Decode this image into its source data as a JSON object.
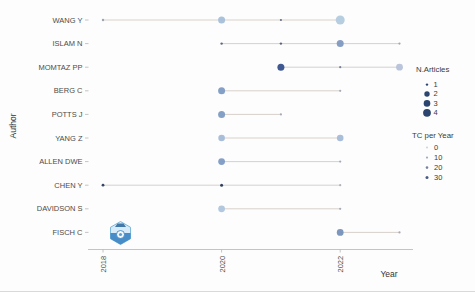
{
  "chart_data": {
    "type": "scatter",
    "title": "",
    "xlabel": "Year",
    "ylabel": "Author",
    "x_ticks": [
      "2018",
      "2020",
      "2022"
    ],
    "x_domain": [
      2017.75,
      2023.5
    ],
    "grid": false,
    "legend_position": "right",
    "authors": [
      "WANG Y",
      "ISLAM N",
      "MOMTAZ PP",
      "BERG C",
      "POTTS J",
      "YANG Z",
      "ALLEN DWE",
      "CHEN Y",
      "DAVIDSON S",
      "FISCH C"
    ],
    "series": [
      {
        "author": "WANG Y",
        "line": [
          2018,
          2022
        ],
        "points": [
          {
            "year": 2018,
            "n_articles": 1,
            "tc_per_year": 2,
            "r": 1.2,
            "color": "#95a0ad"
          },
          {
            "year": 2020,
            "n_articles": 2,
            "tc_per_year": 5,
            "r": 3.5,
            "color": "#a7bfd9"
          },
          {
            "year": 2021,
            "n_articles": 1,
            "tc_per_year": 10,
            "r": 1.1,
            "color": "#5f6d85"
          },
          {
            "year": 2022,
            "n_articles": 3,
            "tc_per_year": 5,
            "r": 4.5,
            "color": "#b3cade"
          }
        ]
      },
      {
        "author": "ISLAM N",
        "line": [
          2020,
          2023
        ],
        "points": [
          {
            "year": 2020,
            "n_articles": 1,
            "tc_per_year": 15,
            "r": 1.2,
            "color": "#525f79"
          },
          {
            "year": 2021,
            "n_articles": 1,
            "tc_per_year": 15,
            "r": 1.2,
            "color": "#525f79"
          },
          {
            "year": 2022,
            "n_articles": 2,
            "tc_per_year": 15,
            "r": 3.5,
            "color": "#8099c1"
          },
          {
            "year": 2023,
            "n_articles": 1,
            "tc_per_year": 5,
            "r": 1.1,
            "color": "#9aa3b2"
          }
        ]
      },
      {
        "author": "MOMTAZ PP",
        "line": [
          2021,
          2023
        ],
        "points": [
          {
            "year": 2021,
            "n_articles": 2,
            "tc_per_year": 30,
            "r": 3.5,
            "color": "#35508c"
          },
          {
            "year": 2022,
            "n_articles": 1,
            "tc_per_year": 10,
            "r": 1.1,
            "color": "#6e7a92"
          },
          {
            "year": 2023,
            "n_articles": 2,
            "tc_per_year": 3,
            "r": 3.4,
            "color": "#b6c1d9"
          }
        ]
      },
      {
        "author": "BERG C",
        "line": [
          2020,
          2022
        ],
        "points": [
          {
            "year": 2020,
            "n_articles": 2,
            "tc_per_year": 15,
            "r": 3.5,
            "color": "#7e9bc4"
          },
          {
            "year": 2022,
            "n_articles": 1,
            "tc_per_year": 0,
            "r": 1.1,
            "color": "#a0a8b4"
          }
        ]
      },
      {
        "author": "POTTS J",
        "line": [
          2020,
          2021
        ],
        "points": [
          {
            "year": 2020,
            "n_articles": 2,
            "tc_per_year": 15,
            "r": 3.5,
            "color": "#7e9bc4"
          },
          {
            "year": 2021,
            "n_articles": 1,
            "tc_per_year": 0,
            "r": 1.1,
            "color": "#a0a8b4"
          }
        ]
      },
      {
        "author": "YANG Z",
        "line": [
          2020,
          2022
        ],
        "points": [
          {
            "year": 2020,
            "n_articles": 2,
            "tc_per_year": 8,
            "r": 3.3,
            "color": "#a3bbd7"
          },
          {
            "year": 2022,
            "n_articles": 2,
            "tc_per_year": 8,
            "r": 3.3,
            "color": "#a3bbd7"
          }
        ]
      },
      {
        "author": "ALLEN DWE",
        "line": [
          2020,
          2022
        ],
        "points": [
          {
            "year": 2020,
            "n_articles": 2,
            "tc_per_year": 15,
            "r": 3.4,
            "color": "#7e9bc4"
          },
          {
            "year": 2022,
            "n_articles": 1,
            "tc_per_year": 0,
            "r": 1.1,
            "color": "#a0a8b4"
          }
        ]
      },
      {
        "author": "CHEN Y",
        "line": [
          2018,
          2022
        ],
        "points": [
          {
            "year": 2018,
            "n_articles": 1,
            "tc_per_year": 30,
            "r": 1.4,
            "color": "#2b3b60"
          },
          {
            "year": 2020,
            "n_articles": 1,
            "tc_per_year": 30,
            "r": 1.5,
            "color": "#27375c"
          },
          {
            "year": 2022,
            "n_articles": 1,
            "tc_per_year": 0,
            "r": 1.1,
            "color": "#a6adb9"
          }
        ]
      },
      {
        "author": "DAVIDSON S",
        "line": [
          2020,
          2022
        ],
        "points": [
          {
            "year": 2020,
            "n_articles": 2,
            "tc_per_year": 5,
            "r": 3.4,
            "color": "#aec5dd"
          },
          {
            "year": 2022,
            "n_articles": 1,
            "tc_per_year": 0,
            "r": 1.1,
            "color": "#a0a8b4"
          }
        ]
      },
      {
        "author": "FISCH C",
        "line": [
          2022,
          2023
        ],
        "points": [
          {
            "year": 2022,
            "n_articles": 2,
            "tc_per_year": 15,
            "r": 3.4,
            "color": "#7590ba"
          },
          {
            "year": 2023,
            "n_articles": 1,
            "tc_per_year": 0,
            "r": 1.1,
            "color": "#a0a8b4"
          }
        ]
      }
    ],
    "legend_articles": {
      "title": "N.Articles",
      "color": "#2b4570",
      "items": [
        {
          "label": "1",
          "r": 1.2
        },
        {
          "label": "2",
          "r": 2.7
        },
        {
          "label": "3",
          "r": 3.3
        },
        {
          "label": "4",
          "r": 3.9
        }
      ]
    },
    "legend_tc": {
      "title": "TC per Year",
      "items": [
        {
          "label": "0",
          "r": 1.0,
          "color": "#cdd3dc"
        },
        {
          "label": "10",
          "r": 1.1,
          "color": "#a3acbd"
        },
        {
          "label": "20",
          "r": 1.3,
          "color": "#77839f"
        },
        {
          "label": "30",
          "r": 1.5,
          "color": "#4a5b82"
        }
      ]
    },
    "colors": {
      "timeline": "#c9beb5",
      "axis": "#b5b5b5",
      "tick_text": "#4c4c4c",
      "label_text": "#333333"
    }
  }
}
